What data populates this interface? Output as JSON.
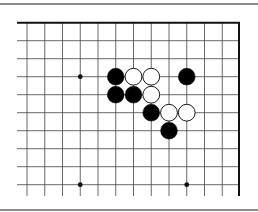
{
  "diagram": {
    "type": "go-board-fragment",
    "columns": 13,
    "rows": 10,
    "origin_x": 27,
    "origin_y": 22.7,
    "spacing_x": 17.75,
    "spacing_y": 18,
    "left_edge_x": 17,
    "right_border_x": 239,
    "bottom_extend_y": 196,
    "stone_radius": 8.4,
    "colors": {
      "line": "#444444",
      "border": "#111111",
      "black": "#000000",
      "white": "#ffffff",
      "rule": "#8a8a8a"
    },
    "star_points": [
      {
        "col": 3,
        "row": 3
      },
      {
        "col": 3,
        "row": 9
      },
      {
        "col": 9,
        "row": 9
      }
    ],
    "stones": [
      {
        "col": 5,
        "row": 3,
        "color": "black"
      },
      {
        "col": 6,
        "row": 3,
        "color": "white"
      },
      {
        "col": 7,
        "row": 3,
        "color": "white"
      },
      {
        "col": 9,
        "row": 3,
        "color": "black"
      },
      {
        "col": 5,
        "row": 4,
        "color": "black"
      },
      {
        "col": 6,
        "row": 4,
        "color": "black"
      },
      {
        "col": 7,
        "row": 4,
        "color": "white"
      },
      {
        "col": 7,
        "row": 5,
        "color": "black"
      },
      {
        "col": 8,
        "row": 5,
        "color": "white"
      },
      {
        "col": 9,
        "row": 5,
        "color": "white"
      },
      {
        "col": 8,
        "row": 6,
        "color": "black"
      }
    ]
  }
}
